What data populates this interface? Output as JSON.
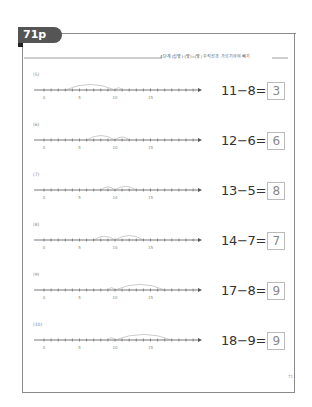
{
  "page": {
    "badge": "71p",
    "header_text": "4단계 (십몇)-(몇)=(몇) 수직선과 가르기하여 빼기",
    "page_number": "71"
  },
  "numberline": {
    "ticks_min": 0,
    "ticks_max": 21,
    "labels": [
      "0",
      "5",
      "10",
      "15"
    ]
  },
  "problems": [
    {
      "label": "(5)",
      "expr": "11−8=",
      "answer": "3",
      "minuend": 11,
      "subtrahend": 8
    },
    {
      "label": "(6)",
      "expr": "12−6=",
      "answer": "6",
      "minuend": 12,
      "subtrahend": 6
    },
    {
      "label": "(7)",
      "expr": "13−5=",
      "answer": "8",
      "minuend": 13,
      "subtrahend": 5
    },
    {
      "label": "(8)",
      "expr": "14−7=",
      "answer": "7",
      "minuend": 14,
      "subtrahend": 7
    },
    {
      "label": "(9)",
      "expr": "17−8=",
      "answer": "9",
      "minuend": 17,
      "subtrahend": 8
    },
    {
      "label": "(10)",
      "expr": "18−9=",
      "answer": "9",
      "minuend": 18,
      "subtrahend": 9
    }
  ],
  "colors": {
    "badge": "#555555",
    "frame": "#8a8a8a",
    "arc": "#999999",
    "text": "#333333"
  }
}
